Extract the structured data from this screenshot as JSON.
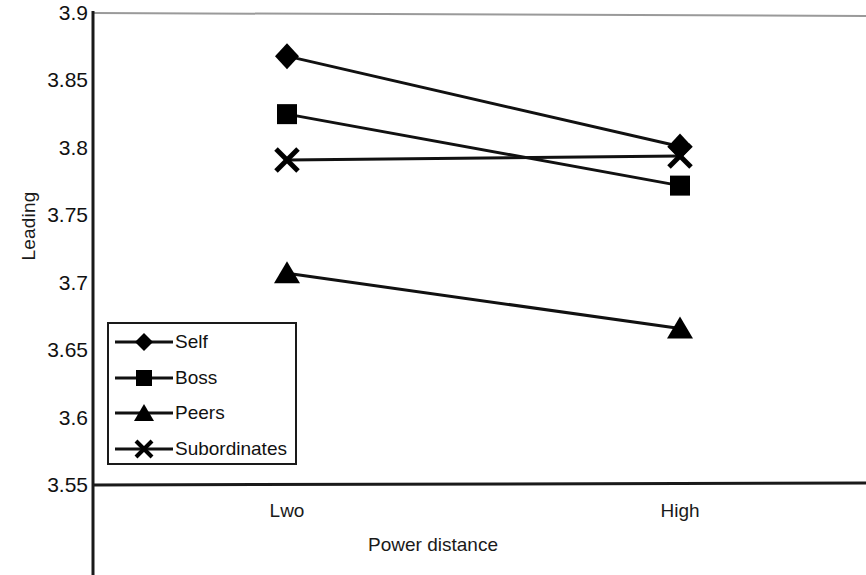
{
  "chart_data": {
    "type": "line",
    "title": "",
    "xlabel": "Power distance",
    "ylabel": "Leading",
    "categories": [
      "Lwo",
      "High"
    ],
    "x": [
      0,
      1
    ],
    "ylim": [
      3.55,
      3.9
    ],
    "yticks": [
      "3.9",
      "3.85",
      "3.8",
      "3.75",
      "3.7",
      "3.65",
      "3.6",
      "3.55"
    ],
    "ytick_values": [
      3.9,
      3.85,
      3.8,
      3.75,
      3.7,
      3.65,
      3.6,
      3.55
    ],
    "grid": false,
    "legend_position": "inside-lower-left",
    "series": [
      {
        "name": "Self",
        "marker": "diamond",
        "values": [
          3.868,
          3.801
        ]
      },
      {
        "name": "Boss",
        "marker": "square",
        "values": [
          3.825,
          3.772
        ]
      },
      {
        "name": "Peers",
        "marker": "triangle",
        "values": [
          3.707,
          3.666
        ]
      },
      {
        "name": "Subordinates",
        "marker": "cross",
        "values": [
          3.791,
          3.794
        ]
      }
    ]
  },
  "axes": {
    "y_title": "Leading",
    "x_title": "Power distance",
    "y_ticks": [
      "3.9",
      "3.85",
      "3.8",
      "3.75",
      "3.7",
      "3.65",
      "3.6",
      "3.55"
    ],
    "x_ticks": [
      "Lwo",
      "High"
    ]
  },
  "legend": {
    "items": [
      {
        "label": "Self"
      },
      {
        "label": "Boss"
      },
      {
        "label": "Peers"
      },
      {
        "label": "Subordinates"
      }
    ]
  },
  "colors": {
    "line": "#111111",
    "marker": "#000000",
    "axis": "#1a1a1a",
    "frame_top": "#8a8a8a",
    "background": "#ffffff"
  }
}
